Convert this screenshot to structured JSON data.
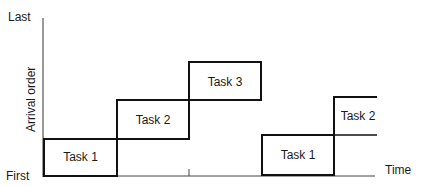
{
  "diagram": {
    "type": "timeline-step",
    "y_axis": {
      "label": "Arrival order",
      "top_label": "Last",
      "bottom_label": "First"
    },
    "x_axis": {
      "label": "Time"
    },
    "tasks": [
      {
        "label": "Task 1",
        "order": 1,
        "segment": "first"
      },
      {
        "label": "Task 2",
        "order": 2,
        "segment": "first"
      },
      {
        "label": "Task 3",
        "order": 3,
        "segment": "first"
      },
      {
        "label": "Task 1",
        "order": 1,
        "segment": "second"
      },
      {
        "label": "Task 2",
        "order": 2,
        "segment": "second"
      }
    ],
    "colors": {
      "line": "#1a1a1a",
      "background": "#ffffff"
    }
  }
}
